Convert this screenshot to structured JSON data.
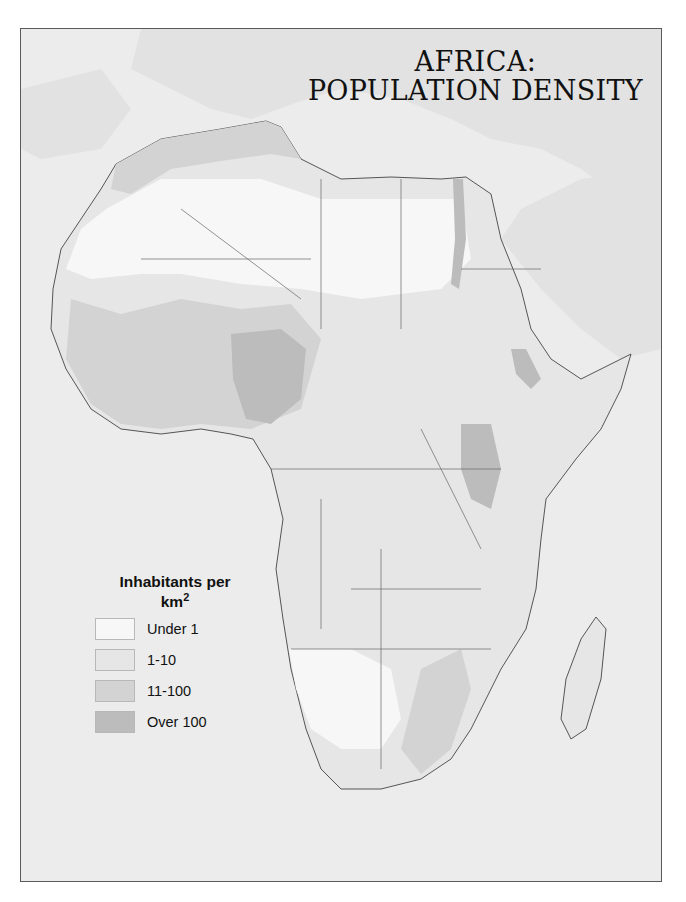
{
  "title": {
    "line1": "AFRICA:",
    "line2": "POPULATION DENSITY"
  },
  "legend": {
    "title": "Inhabitants per",
    "unit": "km",
    "unit_superscript": "2",
    "items": [
      {
        "label": "Under 1",
        "color": "#f7f7f7"
      },
      {
        "label": "1-10",
        "color": "#e6e6e6"
      },
      {
        "label": "11-100",
        "color": "#d3d3d3"
      },
      {
        "label": "Over 100",
        "color": "#bcbcbc"
      }
    ]
  },
  "colors": {
    "sea": "#ececec",
    "surrounding_land": "#e2e2e2",
    "border_line": "#555555",
    "frame": "#5a5a5a"
  }
}
